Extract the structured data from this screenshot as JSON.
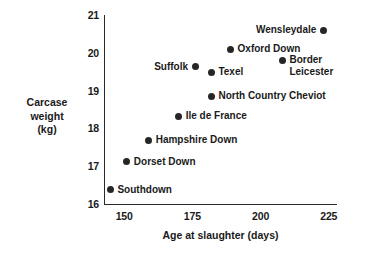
{
  "chart_data": {
    "type": "scatter",
    "title": "",
    "xlabel": "Age at slaughter (days)",
    "ylabel": "Carcase weight (kg)",
    "ylabel_lines": [
      "Carcase",
      "weight",
      "(kg)"
    ],
    "xlim": [
      143,
      228
    ],
    "ylim": [
      16,
      21
    ],
    "xticks": [
      150,
      175,
      200,
      225
    ],
    "xtick_labels": [
      "150",
      "175",
      "200",
      "225"
    ],
    "yticks": [
      16,
      17,
      18,
      19,
      20,
      21
    ],
    "ytick_labels": [
      "16",
      "17",
      "18",
      "19",
      "20",
      "21"
    ],
    "grid": false,
    "legend": "none",
    "marker": "filled-circle",
    "marker_color": "#262626",
    "points": [
      {
        "name": "Southdown",
        "label": "Southdown",
        "x": 145,
        "y": 16.38,
        "label_side": "right",
        "lines": 1
      },
      {
        "name": "Dorset Down",
        "label": "Dorset Down",
        "x": 151,
        "y": 17.12,
        "label_side": "right",
        "lines": 1
      },
      {
        "name": "Hampshire Down",
        "label": "Hampshire Down",
        "x": 159,
        "y": 17.68,
        "label_side": "right",
        "lines": 1
      },
      {
        "name": "Ile de France",
        "label": "Ile de France",
        "x": 170,
        "y": 18.32,
        "label_side": "right",
        "lines": 1
      },
      {
        "name": "North Country Cheviot",
        "label": "North Country Cheviot",
        "x": 182,
        "y": 18.85,
        "label_side": "right",
        "lines": 1
      },
      {
        "name": "Suffolk",
        "label": "Suffolk",
        "x": 176,
        "y": 19.63,
        "label_side": "left",
        "lines": 1
      },
      {
        "name": "Texel",
        "label": "Texel",
        "x": 182,
        "y": 19.48,
        "label_side": "right",
        "lines": 1
      },
      {
        "name": "Oxford Down",
        "label": "Oxford Down",
        "x": 189,
        "y": 20.1,
        "label_side": "right",
        "lines": 1
      },
      {
        "name": "Border Leicester",
        "label": "Border\nLeicester",
        "x": 208,
        "y": 19.8,
        "label_side": "right",
        "lines": 2
      },
      {
        "name": "Wensleydale",
        "label": "Wensleydale",
        "x": 223,
        "y": 20.6,
        "label_side": "left",
        "lines": 1
      }
    ]
  },
  "axes": {
    "x_title": "Age at slaughter (days)",
    "y_title_line1": "Carcase",
    "y_title_line2": "weight",
    "y_title_line3": "(kg)"
  },
  "colors": {
    "marker": "#262626",
    "axis": "#2a2a2a",
    "text": "#1a1a1a",
    "background": "#ffffff"
  }
}
